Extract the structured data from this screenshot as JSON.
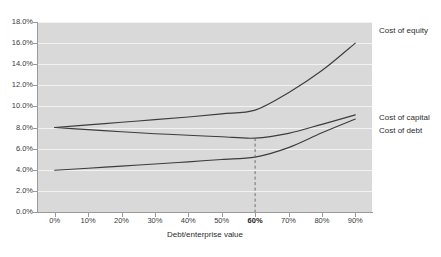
{
  "chart_data": {
    "type": "line",
    "title": "",
    "xlabel": "Debt/enterprise value",
    "ylabel": "",
    "xlim": [
      0,
      90
    ],
    "ylim": [
      0,
      18
    ],
    "grid": true,
    "legend_position": "right-inline-labels",
    "x_tick_labels": [
      "0%",
      "10%",
      "20%",
      "30%",
      "40%",
      "50%",
      "60%",
      "70%",
      "80%",
      "90%"
    ],
    "x_tick_values": [
      0,
      10,
      20,
      30,
      40,
      50,
      60,
      70,
      80,
      90
    ],
    "x_tick_emphasis": "60%",
    "y_tick_labels": [
      "0.0%",
      "2.0%",
      "4.0%",
      "6.0%",
      "8.0%",
      "10.0%",
      "12.0%",
      "14.0%",
      "16.0%",
      "18.0%"
    ],
    "y_tick_values": [
      0,
      2,
      4,
      6,
      8,
      10,
      12,
      14,
      16,
      18
    ],
    "x": [
      0,
      10,
      20,
      30,
      40,
      50,
      60,
      70,
      80,
      90
    ],
    "series": [
      {
        "name": "Cost of equity",
        "values": [
          8.0,
          8.25,
          8.5,
          8.75,
          9.0,
          9.3,
          9.65,
          11.3,
          13.4,
          16.0
        ]
      },
      {
        "name": "Cost of capital",
        "values": [
          8.0,
          7.8,
          7.6,
          7.42,
          7.27,
          7.13,
          7.0,
          7.45,
          8.3,
          9.2
        ]
      },
      {
        "name": "Cost of debt",
        "values": [
          3.95,
          4.15,
          4.35,
          4.55,
          4.75,
          4.98,
          5.2,
          6.1,
          7.5,
          8.8
        ]
      }
    ],
    "annotations": [
      {
        "type": "vertical-dashed-line",
        "at_x": 60,
        "from_y": 0,
        "to_y": 7.0,
        "note": "optimal capital structure marker at 60% debt/enterprise value"
      }
    ],
    "colors": {
      "plot_background": "#d9d9d9",
      "grid": "#f2f2f2",
      "line": "#3c3c3c",
      "axis": "#9a9a9a",
      "text": "#2c2c2c",
      "page_background": "#ffffff"
    }
  },
  "series_labels": [
    {
      "text": "Cost of equity",
      "top": 26,
      "left": 379
    },
    {
      "text": "Cost of capital",
      "top": 113,
      "left": 379
    },
    {
      "text": "Cost of debt",
      "top": 126,
      "left": 379
    }
  ]
}
